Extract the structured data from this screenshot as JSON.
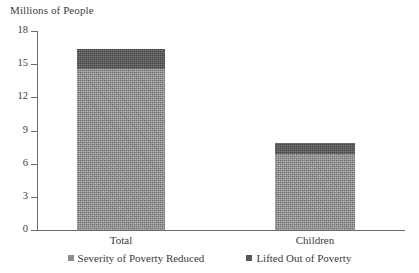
{
  "chart_data": {
    "type": "bar",
    "subtype": "stacked-bar",
    "title": "Millions of People",
    "xlabel": "",
    "ylabel": "Millions of People",
    "categories": [
      "Total",
      "Children"
    ],
    "series": [
      {
        "name": "Severity of Poverty Reduced",
        "values": [
          14.6,
          6.9
        ],
        "color": "#8e8e8e"
      },
      {
        "name": "Lifted Out of Poverty",
        "values": [
          1.8,
          1.0
        ],
        "color": "#575757"
      }
    ],
    "totals": [
      16.4,
      7.9
    ],
    "ylim": [
      0,
      18
    ],
    "yticks": [
      0,
      3,
      6,
      9,
      12,
      15,
      18
    ],
    "ytick_labels": [
      "0",
      "3",
      "6",
      "9",
      "12",
      "15",
      "18"
    ],
    "grid": false,
    "legend_position": "bottom"
  },
  "axis": {
    "title": "Millions of People",
    "ytick_labels": [
      "18",
      "15",
      "12",
      "9",
      "6",
      "3",
      "0"
    ],
    "ytick_values": [
      18,
      15,
      12,
      9,
      6,
      3,
      0
    ]
  },
  "categories": [
    {
      "label": "Total"
    },
    {
      "label": "Children"
    }
  ],
  "legend": {
    "items": [
      {
        "label": "Severity of Poverty Reduced",
        "swatch": "light-gray-square",
        "color": "#8e8e8e"
      },
      {
        "label": "Lifted Out of Poverty",
        "swatch": "dark-gray-square",
        "color": "#575757"
      }
    ]
  },
  "colors": {
    "series_light": "#8e8e8e",
    "series_dark": "#575757",
    "axis": "#6d6d6d",
    "text": "#3c3c3c",
    "background": "#ffffff"
  }
}
